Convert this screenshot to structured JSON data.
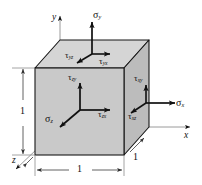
{
  "figure": {
    "cube": {
      "fill_color": "#c8c8c8",
      "top_face_color": "#d7d7d7",
      "right_face_color": "#bdbdbd",
      "edge_color": "#1a1a1a"
    },
    "axes": [
      {
        "name": "y-axis",
        "label": "y",
        "direction": "up"
      },
      {
        "name": "x-axis",
        "label": "x",
        "direction": "right"
      },
      {
        "name": "z-axis",
        "label": "z",
        "direction": "down-left"
      }
    ],
    "normal_stresses": [
      {
        "name": "sigma-y",
        "glyph": "σ",
        "subscript": "y",
        "face": "top",
        "direction": "up"
      },
      {
        "name": "sigma-x",
        "glyph": "σ",
        "subscript": "x",
        "face": "right",
        "direction": "right"
      },
      {
        "name": "sigma-z",
        "glyph": "σ",
        "subscript": "z",
        "face": "front",
        "direction": "toward-origin"
      }
    ],
    "shear_stresses": [
      {
        "name": "tau-yz",
        "glyph": "τ",
        "subscript": "yz",
        "face": "top",
        "direction": "down-left"
      },
      {
        "name": "tau-yx",
        "glyph": "τ",
        "subscript": "yx",
        "face": "top",
        "direction": "right"
      },
      {
        "name": "tau-zy",
        "glyph": "τ",
        "subscript": "zy",
        "face": "front",
        "direction": "up"
      },
      {
        "name": "tau-zx",
        "glyph": "τ",
        "subscript": "zx",
        "face": "front",
        "direction": "right"
      },
      {
        "name": "tau-xy",
        "glyph": "τ",
        "subscript": "xy",
        "face": "right",
        "direction": "up"
      },
      {
        "name": "tau-xz",
        "glyph": "τ",
        "subscript": "xz",
        "face": "right",
        "direction": "down-left"
      }
    ],
    "dimensions": [
      {
        "name": "height-dimension",
        "value": "1",
        "orientation": "vertical",
        "side": "left"
      },
      {
        "name": "width-dimension",
        "value": "1",
        "orientation": "horizontal",
        "side": "bottom"
      },
      {
        "name": "depth-dimension",
        "value": "1",
        "orientation": "diagonal",
        "side": "bottom-right"
      }
    ]
  }
}
